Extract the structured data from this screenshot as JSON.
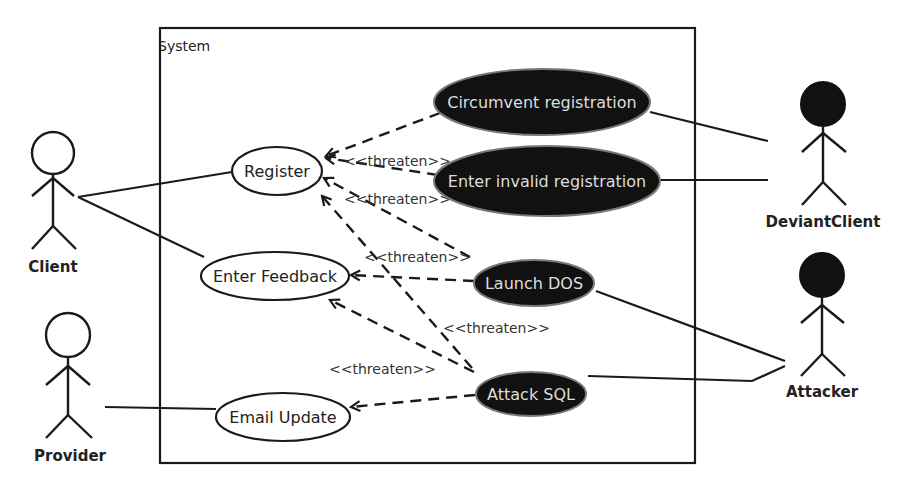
{
  "system": {
    "label": "System"
  },
  "actors": {
    "client": {
      "label": "Client",
      "type": "legitimate"
    },
    "provider": {
      "label": "Provider",
      "type": "legitimate"
    },
    "deviant_client": {
      "label": "DeviantClient",
      "type": "misuser"
    },
    "attacker": {
      "label": "Attacker",
      "type": "misuser"
    }
  },
  "use_cases": {
    "register": {
      "label": "Register"
    },
    "enter_feedback": {
      "label": "Enter Feedback"
    },
    "email_update": {
      "label": "Email Update"
    }
  },
  "misuse_cases": {
    "circumvent_registration": {
      "label": "Circumvent registration"
    },
    "enter_invalid_registration": {
      "label": "Enter invalid registration"
    },
    "launch_dos": {
      "label": "Launch DOS"
    },
    "attack_sql": {
      "label": "Attack SQL"
    }
  },
  "relations": {
    "stereotype": "<<threaten>>",
    "labels": [
      {
        "id": "t1",
        "text": "<<threaten>>"
      },
      {
        "id": "t2",
        "text": "<<threaten>>"
      },
      {
        "id": "t3",
        "text": "<<threaten>>"
      },
      {
        "id": "t4",
        "text": "<<threaten>>"
      },
      {
        "id": "t5",
        "text": "<<threaten>>"
      }
    ]
  },
  "colors": {
    "misuse_fill": "#111111",
    "usecase_fill": "#ffffff",
    "line": "#1a1a1a"
  }
}
